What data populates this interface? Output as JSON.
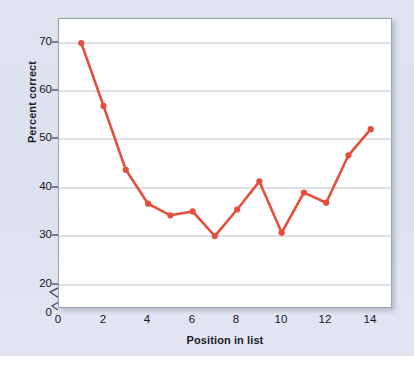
{
  "chart_data": {
    "type": "line",
    "title": "",
    "xlabel": "Position in list",
    "ylabel": "Percent correct",
    "x": [
      1,
      2,
      3,
      4,
      5,
      6,
      7,
      8,
      9,
      10,
      11,
      12,
      13,
      14
    ],
    "values": [
      70,
      57,
      43.8,
      36.8,
      34.4,
      35.2,
      30.1,
      35.6,
      41.4,
      30.8,
      39.1,
      37,
      46.8,
      52.2
    ],
    "series": [
      {
        "name": "Percent correct",
        "values": [
          70,
          57,
          43.8,
          36.8,
          34.4,
          35.2,
          30.1,
          35.6,
          41.4,
          30.8,
          39.1,
          37,
          46.8,
          52.2
        ]
      }
    ],
    "xlim": [
      0,
      15
    ],
    "ylim": [
      17,
      74
    ],
    "y_axis_break": true,
    "y_break_between": [
      0,
      20
    ],
    "xticks": [
      0,
      2,
      4,
      6,
      8,
      10,
      12,
      14
    ],
    "xtick_labels": [
      "0",
      "2",
      "4",
      "6",
      "8",
      "10",
      "12",
      "14"
    ],
    "yticks": [
      20,
      30,
      40,
      50,
      60,
      70
    ],
    "ytick_labels": [
      "20",
      "30",
      "40",
      "50",
      "60",
      "70"
    ],
    "y_zero_label": "0",
    "grid": "horizontal",
    "legend": "none",
    "line_color": "#e2503c",
    "marker_color": "#e2503c",
    "marker_shape": "circle",
    "annotations": [
      {
        "text": "Primacy effect",
        "near_point_x": 1,
        "near_point_y": 70
      },
      {
        "text": "Recency effect",
        "near_point_x": 14,
        "near_point_y": 52.2
      }
    ]
  },
  "figure": {
    "panel_background": "#dfe3f0",
    "plot_background": "#ffffff",
    "grid_color": "#b9bdcd",
    "axis_color": "#5b6070",
    "text_color": "#15151f"
  }
}
